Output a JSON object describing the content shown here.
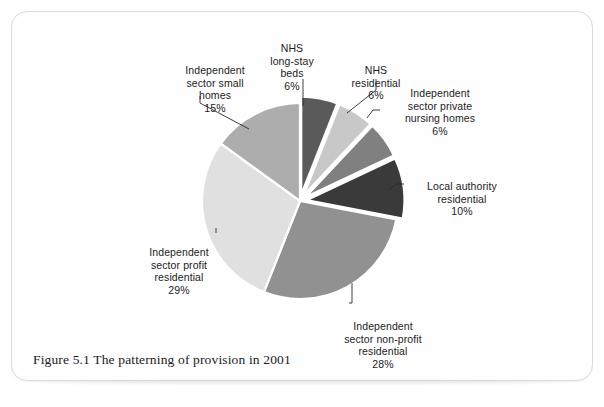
{
  "page": {
    "caption": "Figure 5.1 The patterning of provision in 2001"
  },
  "chart_data": {
    "type": "pie",
    "title": "Figure 5.1 The patterning of provision in 2001",
    "xlabel": "",
    "ylabel": "",
    "legend_position": "none (direct labels with leader lines)",
    "grid": false,
    "units": "percent",
    "total": 100,
    "start_angle_deg": 0,
    "direction": "clockwise",
    "categories": [
      "NHS long-stay beds",
      "NHS residential",
      "Independent sector private nursing homes",
      "Local authority residential",
      "Independent sector non-profit residential",
      "Independent sector profit residential",
      "Independent sector small homes"
    ],
    "values": [
      6,
      6,
      6,
      10,
      28,
      29,
      15
    ],
    "value_labels": [
      "6%",
      "6%",
      "6%",
      "10%",
      "28%",
      "29%",
      "15%"
    ],
    "colors": [
      "#5a5a5a",
      "#c8c8c8",
      "#808080",
      "#3a3a3a",
      "#919191",
      "#e0e0e0",
      "#adadad"
    ],
    "exploded": [
      true,
      true,
      true,
      true,
      false,
      false,
      false
    ],
    "slices": [
      {
        "name": "NHS long-stay beds",
        "label_lines": "NHS\nlong-stay\nbeds",
        "value": 6,
        "value_label": "6%",
        "color": "#5a5a5a",
        "exploded": true
      },
      {
        "name": "NHS residential",
        "label_lines": "NHS\nresidential",
        "value": 6,
        "value_label": "6%",
        "color": "#c8c8c8",
        "exploded": true
      },
      {
        "name": "Independent sector private nursing homes",
        "label_lines": "Independent\nsector private\nnursing homes",
        "value": 6,
        "value_label": "6%",
        "color": "#808080",
        "exploded": true
      },
      {
        "name": "Local authority residential",
        "label_lines": "Local authority\nresidential",
        "value": 10,
        "value_label": "10%",
        "color": "#3a3a3a",
        "exploded": true
      },
      {
        "name": "Independent sector non-profit residential",
        "label_lines": "Independent\nsector non-profit\nresidential",
        "value": 28,
        "value_label": "28%",
        "color": "#919191",
        "exploded": false
      },
      {
        "name": "Independent sector profit residential",
        "label_lines": "Independent\nsector profit\nresidential",
        "value": 29,
        "value_label": "29%",
        "color": "#e0e0e0",
        "exploded": false
      },
      {
        "name": "Independent sector small homes",
        "label_lines": "Independent\nsector small\nhomes",
        "value": 15,
        "value_label": "15%",
        "color": "#adadad",
        "exploded": false
      }
    ]
  }
}
